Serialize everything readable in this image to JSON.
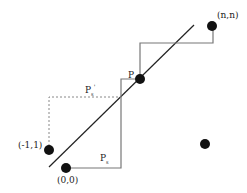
{
  "diagram": {
    "labels": {
      "origin": "(0,0)",
      "neg_point": "(-1,1)",
      "end_point": "(n,n)",
      "p": "P",
      "ps": "P",
      "ps_sub": "s",
      "ps_prime": "P",
      "ps_prime_sub": "s",
      "ps_prime_mark": "'"
    },
    "colors": {
      "dot": "#111111",
      "diagonal": "#222222",
      "path": "#777777",
      "dotted": "#888888"
    }
  }
}
